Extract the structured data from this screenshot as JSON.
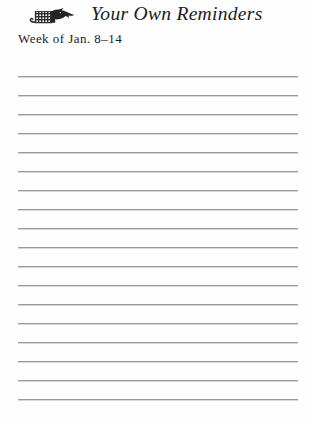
{
  "document": {
    "type": "ruled-notes-page",
    "title": "Your Own Reminders",
    "week_label": "Week of Jan. 8–14",
    "masthead_icon": "plaid-animal-silhouette-icon",
    "background_color": "#fefefe",
    "rule_line_color": "#9a9a9a",
    "text_color": "#1c1c1c"
  },
  "ruled_lines": {
    "count": 18,
    "left_x": 18,
    "right_x": 298,
    "first_y": 76,
    "spacing": 19,
    "y_positions": [
      76,
      95,
      114,
      133,
      152,
      171,
      190,
      209,
      228,
      247,
      266,
      285,
      304,
      323,
      342,
      361,
      380,
      399
    ]
  }
}
